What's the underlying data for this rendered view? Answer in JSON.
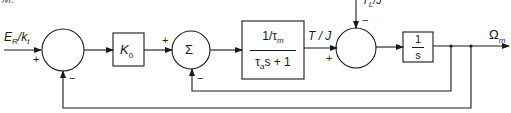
{
  "colors": {
    "stroke": "#1a1a1a",
    "background": "#ffffff"
  },
  "top_cut_text": "M.",
  "input": {
    "label_main": "E",
    "label_sub": "R",
    "label_tail": "/k",
    "label_tail_sub": "t",
    "sign": "+"
  },
  "sum1": {
    "feedback_sign": "−"
  },
  "gain_block": {
    "symbol": "K",
    "sub": "0"
  },
  "sum2": {
    "symbol": "Σ",
    "input_sign": "+",
    "feedback_sign": "−"
  },
  "motor_block": {
    "numerator": "1/τ",
    "numerator_sub": "m",
    "denominator_pre": "τ",
    "denominator_sub": "a",
    "denominator_post": "s + 1"
  },
  "torque_signal": {
    "label": "T / J",
    "sign": "+"
  },
  "sum3": {
    "disturbance_label": "T",
    "disturbance_sub": "L",
    "disturbance_tail": "/J",
    "disturbance_sign": "−"
  },
  "integrator_block": {
    "numerator": "1",
    "denominator": "s"
  },
  "output": {
    "label": "Ω",
    "label_sub": "m"
  }
}
